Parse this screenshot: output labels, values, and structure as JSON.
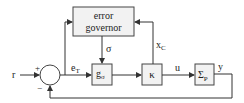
{
  "diagram": {
    "type": "block-diagram",
    "blocks": {
      "error_governor": {
        "line1": "error",
        "line2": "governor"
      },
      "g_sigma": {
        "base": "g",
        "sub": "σ"
      },
      "kappa": {
        "label": "κ"
      },
      "sigma_p": {
        "base": "Σ",
        "sub": "P"
      }
    },
    "summing_junction": {
      "plus": "+",
      "minus": "−"
    },
    "signals": {
      "r": "r",
      "e_t": {
        "base": "e",
        "sub": "T"
      },
      "sigma": "σ",
      "x_c": {
        "base": "x",
        "sub": "C"
      },
      "u": "u",
      "y": "y"
    },
    "colors": {
      "line": "#333333",
      "block_fill": "#f2f2f2"
    }
  }
}
